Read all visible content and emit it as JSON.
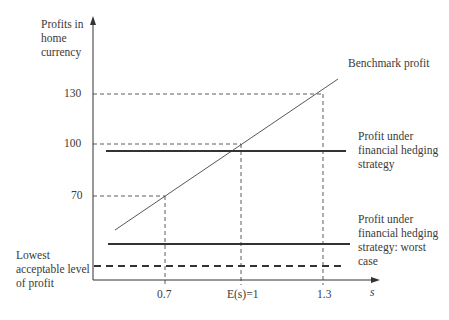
{
  "diagram": {
    "y_axis_label": "Profits in\nhome\ncurrency",
    "x_axis_label": "s",
    "y_ticks": [
      {
        "label": "130",
        "value": 130
      },
      {
        "label": "100",
        "value": 100
      },
      {
        "label": "70",
        "value": 70
      }
    ],
    "x_ticks": [
      {
        "label": "0.7",
        "value": 0.7
      },
      {
        "label": "E(s)=1",
        "value": 1.0
      },
      {
        "label": "1.3",
        "value": 1.3
      }
    ],
    "lines": {
      "benchmark": {
        "label": "Benchmark profit",
        "style": "thin solid diagonal"
      },
      "hedging": {
        "label": "Profit under\nfinancial hedging\nstrategy",
        "style": "thick solid horizontal"
      },
      "hedging_worst": {
        "label": "Profit under\nfinancial hedging\nstrategy: worst\ncase",
        "style": "thick solid horizontal"
      },
      "lowest_acceptable": {
        "label": "Lowest\nacceptable level\nof profit",
        "style": "thick dashed horizontal"
      }
    },
    "colors": {
      "line": "#333333",
      "text": "#3a3a3a",
      "background": "#ffffff"
    }
  }
}
